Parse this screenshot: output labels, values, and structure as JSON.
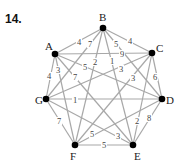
{
  "problem_number": "14.",
  "graph": {
    "type": "complete weighted graph K7",
    "nodes": [
      {
        "id": "A",
        "x": 55,
        "y": 54,
        "lx": 45,
        "ly": 50
      },
      {
        "id": "B",
        "x": 103,
        "y": 28,
        "lx": 99,
        "ly": 21
      },
      {
        "id": "C",
        "x": 152,
        "y": 53,
        "lx": 156,
        "ly": 52
      },
      {
        "id": "D",
        "x": 162,
        "y": 99,
        "lx": 166,
        "ly": 104
      },
      {
        "id": "E",
        "x": 133,
        "y": 145,
        "lx": 134,
        "ly": 160
      },
      {
        "id": "F",
        "x": 75,
        "y": 145,
        "lx": 70,
        "ly": 160
      },
      {
        "id": "G",
        "x": 46,
        "y": 99,
        "lx": 35,
        "ly": 104
      }
    ],
    "edges": [
      {
        "u": "A",
        "v": "B",
        "w": "4",
        "lx": 78,
        "ly": 45
      },
      {
        "u": "B",
        "v": "C",
        "w": "4",
        "lx": 129,
        "ly": 44
      },
      {
        "u": "A",
        "v": "C",
        "w": "9",
        "lx": 121,
        "ly": 57
      },
      {
        "u": "C",
        "v": "D",
        "w": "6",
        "lx": 154,
        "ly": 80
      },
      {
        "u": "B",
        "v": "G",
        "w": "7",
        "lx": 89,
        "ly": 47
      },
      {
        "u": "B",
        "v": "D",
        "w": "5",
        "lx": 115,
        "ly": 47
      },
      {
        "u": "B",
        "v": "F",
        "w": "2",
        "lx": 94,
        "ly": 65
      },
      {
        "u": "B",
        "v": "E",
        "w": "1",
        "lx": 111,
        "ly": 64
      },
      {
        "u": "A",
        "v": "D",
        "w": "5",
        "lx": 84,
        "ly": 70
      },
      {
        "u": "A",
        "v": "E",
        "w": "7",
        "lx": 74,
        "ly": 80
      },
      {
        "u": "A",
        "v": "F",
        "w": "3",
        "lx": 57,
        "ly": 73
      },
      {
        "u": "A",
        "v": "G",
        "w": "4",
        "lx": 48,
        "ly": 79
      },
      {
        "u": "C",
        "v": "G",
        "w": "3",
        "lx": 120,
        "ly": 72
      },
      {
        "u": "C",
        "v": "F",
        "w": "3",
        "lx": 132,
        "ly": 81
      },
      {
        "u": "C",
        "v": "E",
        "w": "2",
        "lx": 136,
        "ly": 124
      },
      {
        "u": "G",
        "v": "D",
        "w": "1",
        "lx": 74,
        "ly": 103
      },
      {
        "u": "G",
        "v": "F",
        "w": "7",
        "lx": 58,
        "ly": 124
      },
      {
        "u": "G",
        "v": "E",
        "w": "3",
        "lx": 117,
        "ly": 139
      },
      {
        "u": "D",
        "v": "E",
        "w": "8",
        "lx": 148,
        "ly": 121
      },
      {
        "u": "D",
        "v": "F",
        "w": "5",
        "lx": 91,
        "ly": 137
      },
      {
        "u": "F",
        "v": "E",
        "w": "5",
        "lx": 103,
        "ly": 148
      }
    ]
  }
}
